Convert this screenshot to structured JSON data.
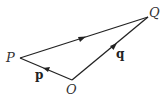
{
  "diagram": {
    "type": "vector-triangle",
    "points": {
      "P": {
        "label": "P",
        "x": 20,
        "y": 58
      },
      "O": {
        "label": "O",
        "x": 72,
        "y": 80
      },
      "Q": {
        "label": "Q",
        "x": 148,
        "y": 17
      }
    },
    "vectors": [
      {
        "from": "O",
        "to": "P",
        "label": "p"
      },
      {
        "from": "O",
        "to": "Q",
        "label": "q"
      },
      {
        "from": "P",
        "to": "Q",
        "label": ""
      }
    ],
    "line_color": "#222222"
  }
}
